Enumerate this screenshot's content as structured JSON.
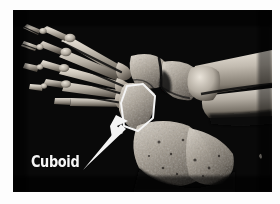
{
  "figure": {
    "kind": "anatomical-photograph",
    "modality": "skeletal specimen photograph",
    "palette": "grayscale",
    "background_color": "#050505",
    "page_background_color": "#fdfdfd",
    "bone_light_color": "#d9d4cb",
    "bone_mid_color": "#a59d92",
    "bone_dark_color": "#6b6459",
    "annotation_color": "#f4f4f4",
    "view": "lateral view of right foot and ankle skeleton"
  },
  "annotations": {
    "label": "Cuboid",
    "label_color": "#f6f6f6",
    "outline": {
      "name": "cuboid-outline",
      "shape": "heptagon",
      "stroke_color": "#f4f4f4",
      "stroke_width": 2,
      "points": "114,76 130,74 142,86 140,108 125,121 111,116 108,93"
    },
    "arrow": {
      "name": "cuboid-pointer-arrow",
      "fill_color": "#f4f4f4",
      "tip_x": 111,
      "tip_y": 114,
      "tail_x": 69,
      "tail_y": 158
    }
  },
  "structures": [
    {
      "name": "phalanges",
      "region": "upper-left"
    },
    {
      "name": "metatarsals",
      "region": "left / mid-left"
    },
    {
      "name": "cuboid",
      "region": "center",
      "highlighted": true
    },
    {
      "name": "navicular",
      "region": "center-upper"
    },
    {
      "name": "calcaneus",
      "region": "lower-right"
    },
    {
      "name": "talus",
      "region": "right-center"
    },
    {
      "name": "tibia",
      "region": "right edge"
    },
    {
      "name": "fibula",
      "region": "right edge, posterior"
    }
  ]
}
